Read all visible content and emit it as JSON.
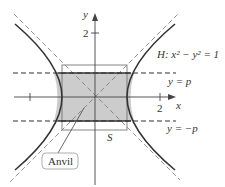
{
  "diagram": {
    "axes": {
      "x_label": "x",
      "y_label": "y",
      "x_tick_label": "2",
      "y_tick_label": "2"
    },
    "curve_label": "H: x² − y² = 1",
    "line_labels": {
      "upper": "y = p",
      "lower": "y = −p"
    },
    "square_label": "S",
    "callout_label": "Anvil",
    "colors": {
      "shade": "#cccccc",
      "curve": "#333333",
      "dash": "#555555",
      "square": "#666666"
    }
  }
}
